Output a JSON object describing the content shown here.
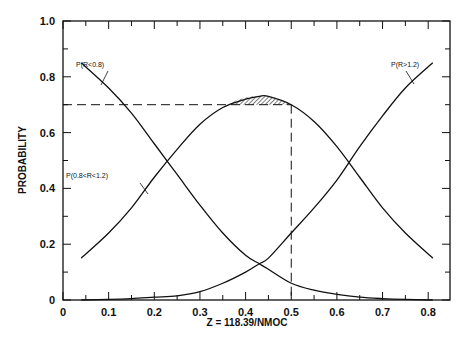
{
  "chart_data": {
    "type": "line",
    "title": "",
    "xlabel": "Z = 118.39/NMOC",
    "ylabel": "PROBABILITY",
    "xlim": [
      0,
      0.85
    ],
    "ylim": [
      0,
      1.0
    ],
    "xticks": [
      "0",
      "0.1",
      "0.2",
      "0.3",
      "0.4",
      "0.5",
      "0.6",
      "0.7",
      "0.8"
    ],
    "yticks": [
      "0",
      "0.2",
      "0.4",
      "0.6",
      "0.8",
      "1.0"
    ],
    "grid": false,
    "x": [
      0.04,
      0.1,
      0.15,
      0.2,
      0.25,
      0.3,
      0.35,
      0.4,
      0.43,
      0.45,
      0.5,
      0.55,
      0.6,
      0.65,
      0.7,
      0.75,
      0.81
    ],
    "series": [
      {
        "name": "P(R<0.8)",
        "values": [
          0.85,
          0.76,
          0.67,
          0.56,
          0.45,
          0.34,
          0.24,
          0.16,
          0.13,
          0.11,
          0.06,
          0.035,
          0.02,
          0.01,
          0.005,
          0.002,
          0.0
        ]
      },
      {
        "name": "P(0.8<R<1.2)",
        "values": [
          0.15,
          0.24,
          0.33,
          0.44,
          0.54,
          0.63,
          0.69,
          0.72,
          0.73,
          0.73,
          0.7,
          0.64,
          0.55,
          0.44,
          0.33,
          0.24,
          0.15
        ]
      },
      {
        "name": "P(R>1.2)",
        "values": [
          0.0,
          0.002,
          0.005,
          0.01,
          0.015,
          0.03,
          0.06,
          0.1,
          0.13,
          0.15,
          0.24,
          0.33,
          0.43,
          0.55,
          0.66,
          0.76,
          0.85
        ]
      }
    ],
    "annotations": [
      {
        "text": "P(R<0.8)",
        "x": 0.1,
        "y": 0.8
      },
      {
        "text": "P(0.8<R<1.2)",
        "x": 0.1,
        "y": 0.4
      },
      {
        "text": "P(R>1.2)",
        "x": 0.74,
        "y": 0.83
      },
      {
        "type": "dashed-hline",
        "y": 0.7,
        "x_from": 0,
        "x_to": 0.5
      },
      {
        "type": "dashed-vline",
        "x": 0.5,
        "y_from": 0,
        "y_to": 0.7
      },
      {
        "type": "hatched-region",
        "description": "area of P(0.8<R<1.2) curve above 0.70"
      }
    ]
  },
  "labels": {
    "xlabel": "Z = 118.39/NMOC",
    "ylabel": "PROBABILITY",
    "ann_low": "P(R<0.8)",
    "ann_mid": "P(0.8<R<1.2)",
    "ann_high": "P(R>1.2)"
  }
}
